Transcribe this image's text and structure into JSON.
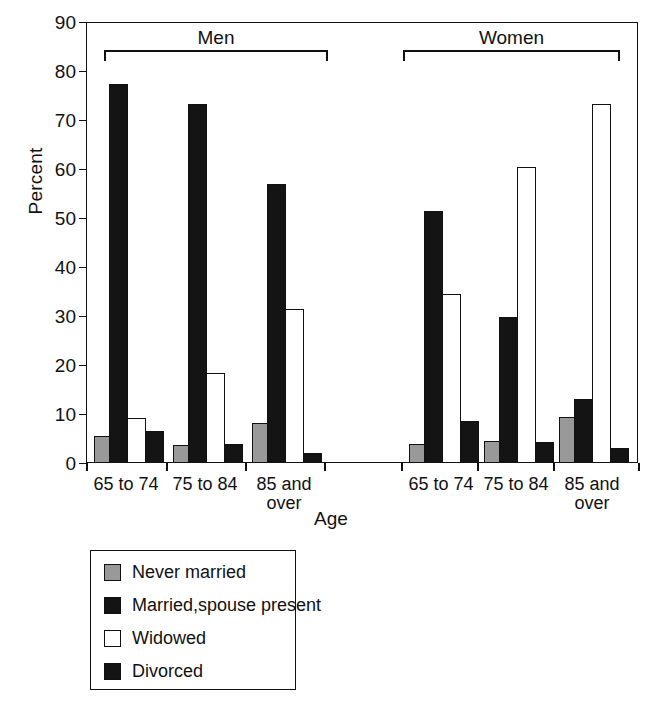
{
  "chart_data": {
    "type": "bar",
    "title": "",
    "xlabel": "Age",
    "ylabel": "Percent",
    "ylim": [
      0,
      90
    ],
    "ytick_step": 10,
    "yticks": [
      "90",
      "80",
      "70",
      "60",
      "50",
      "40",
      "30",
      "20",
      "10",
      "0"
    ],
    "grid": false,
    "legend_position": "below-plot",
    "group_headers": [
      "Men",
      "Women"
    ],
    "categories": [
      "65 to 74",
      "75 to 84",
      "85 and over",
      "65 to 74",
      "75 to 84",
      "85 and over"
    ],
    "category_lines": [
      [
        "65 to 74"
      ],
      [
        "75 to 84"
      ],
      [
        "85 and",
        "over"
      ],
      [
        "65 to 74"
      ],
      [
        "75 to 84"
      ],
      [
        "85 and",
        "over"
      ]
    ],
    "series": [
      {
        "name": "Never married",
        "color": "#999999",
        "values": [
          5.6,
          3.7,
          8.2,
          3.9,
          4.5,
          9.4
        ]
      },
      {
        "name": "Married,spouse present",
        "color": "#141414",
        "values": [
          77.3,
          73.2,
          57.0,
          51.4,
          29.7,
          13.0
        ]
      },
      {
        "name": "Widowed",
        "color": "#ffffff",
        "values": [
          9.2,
          18.3,
          31.4,
          34.5,
          60.4,
          73.2
        ]
      },
      {
        "name": "Divorced",
        "color": "#141414",
        "values": [
          6.5,
          3.9,
          2.0,
          8.5,
          4.3,
          3.0
        ]
      }
    ]
  },
  "axes": {
    "y_title": "Percent",
    "x_title": "Age"
  },
  "groups": {
    "men_label": "Men",
    "women_label": "Women"
  },
  "legend": {
    "items": [
      {
        "label": "Never married",
        "swatch": "never-married-swatch"
      },
      {
        "label": "Married,spouse present",
        "swatch": "married-spouse-present-swatch"
      },
      {
        "label": "Widowed",
        "swatch": "widowed-swatch"
      },
      {
        "label": "Divorced",
        "swatch": "divorced-swatch"
      }
    ]
  },
  "colors": {
    "never_married": "#999999",
    "married": "#141414",
    "widowed": "#ffffff",
    "divorced": "#141414",
    "axis": "#111111",
    "background": "#ffffff"
  }
}
